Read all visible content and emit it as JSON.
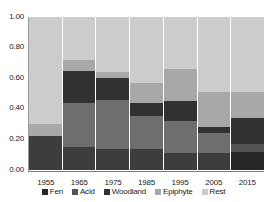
{
  "chart_data": {
    "type": "bar",
    "subtype": "stacked-bar-100",
    "title": "",
    "xlabel": "",
    "ylabel": "",
    "ylim": [
      0.0,
      1.0
    ],
    "ytick_labels": [
      "1.00",
      "0.80",
      "0.60",
      "0.40",
      "0.20",
      "0.00"
    ],
    "ytick_values": [
      1.0,
      0.8,
      0.6,
      0.4,
      0.2,
      0.0
    ],
    "grid": false,
    "legend_position": "bottom",
    "categories": [
      "1955",
      "1965",
      "1975",
      "1985",
      "1995",
      "2005",
      "2015"
    ],
    "series": [
      {
        "name": "Fen",
        "color": "#262626",
        "values": [
          0.0,
          0.0,
          0.0,
          0.0,
          0.0,
          0.0,
          0.12
        ]
      },
      {
        "name": "Acid",
        "color": "#3d3d3d",
        "values": [
          0.22,
          0.15,
          0.14,
          0.14,
          0.11,
          0.11,
          0.05
        ]
      },
      {
        "name": "Woodland",
        "color": "#6e6e6e",
        "values": [
          0.0,
          0.29,
          0.32,
          0.21,
          0.21,
          0.13,
          0.05
        ]
      },
      {
        "name": "Epiphyte",
        "color": "#313131",
        "values": [
          0.0,
          0.21,
          0.14,
          0.08,
          0.13,
          0.04,
          0.12
        ]
      },
      {
        "name": "Rest",
        "color": "#a8a8a8",
        "values": [
          0.08,
          0.07,
          0.0,
          0.14,
          0.21,
          0.23,
          0.17
        ]
      },
      {
        "name": "Top",
        "color": "#cccccc",
        "values": [
          0.7,
          0.28,
          0.4,
          0.43,
          0.34,
          0.49,
          0.49
        ]
      }
    ],
    "stacks": [
      {
        "category": "1955",
        "segments": [
          {
            "name": "Acid",
            "value": 0.22,
            "color": "#3d3d3d"
          },
          {
            "name": "Epiphyte",
            "value": 0.08,
            "color": "#a8a8a8"
          },
          {
            "name": "Rest",
            "value": 0.7,
            "color": "#cccccc"
          }
        ]
      },
      {
        "category": "1965",
        "segments": [
          {
            "name": "Acid",
            "value": 0.15,
            "color": "#3d3d3d"
          },
          {
            "name": "Woodland-lower",
            "value": 0.29,
            "color": "#6e6e6e"
          },
          {
            "name": "Woodland",
            "value": 0.21,
            "color": "#313131"
          },
          {
            "name": "Epiphyte",
            "value": 0.07,
            "color": "#a8a8a8"
          },
          {
            "name": "Rest",
            "value": 0.28,
            "color": "#cccccc"
          }
        ]
      },
      {
        "category": "1975",
        "segments": [
          {
            "name": "Acid",
            "value": 0.14,
            "color": "#3d3d3d"
          },
          {
            "name": "Woodland-lower",
            "value": 0.32,
            "color": "#6e6e6e"
          },
          {
            "name": "Woodland",
            "value": 0.14,
            "color": "#313131"
          },
          {
            "name": "Epiphyte",
            "value": 0.04,
            "color": "#a8a8a8"
          },
          {
            "name": "Rest",
            "value": 0.36,
            "color": "#cccccc"
          }
        ]
      },
      {
        "category": "1985",
        "segments": [
          {
            "name": "Acid",
            "value": 0.14,
            "color": "#3d3d3d"
          },
          {
            "name": "Woodland-lower",
            "value": 0.21,
            "color": "#6e6e6e"
          },
          {
            "name": "Woodland",
            "value": 0.09,
            "color": "#313131"
          },
          {
            "name": "Epiphyte",
            "value": 0.13,
            "color": "#a8a8a8"
          },
          {
            "name": "Rest",
            "value": 0.43,
            "color": "#cccccc"
          }
        ]
      },
      {
        "category": "1995",
        "segments": [
          {
            "name": "Acid",
            "value": 0.11,
            "color": "#3d3d3d"
          },
          {
            "name": "Woodland-lower",
            "value": 0.21,
            "color": "#6e6e6e"
          },
          {
            "name": "Woodland",
            "value": 0.13,
            "color": "#313131"
          },
          {
            "name": "Epiphyte",
            "value": 0.21,
            "color": "#a8a8a8"
          },
          {
            "name": "Rest",
            "value": 0.34,
            "color": "#cccccc"
          }
        ]
      },
      {
        "category": "2005",
        "segments": [
          {
            "name": "Acid",
            "value": 0.11,
            "color": "#3d3d3d"
          },
          {
            "name": "Woodland-lower",
            "value": 0.13,
            "color": "#6e6e6e"
          },
          {
            "name": "Woodland",
            "value": 0.04,
            "color": "#313131"
          },
          {
            "name": "Epiphyte",
            "value": 0.23,
            "color": "#a8a8a8"
          },
          {
            "name": "Rest",
            "value": 0.49,
            "color": "#cccccc"
          }
        ]
      },
      {
        "category": "2015",
        "segments": [
          {
            "name": "Fen",
            "value": 0.12,
            "color": "#262626"
          },
          {
            "name": "Acid",
            "value": 0.05,
            "color": "#545454"
          },
          {
            "name": "Woodland",
            "value": 0.17,
            "color": "#313131"
          },
          {
            "name": "Epiphyte",
            "value": 0.17,
            "color": "#a8a8a8"
          },
          {
            "name": "Rest",
            "value": 0.49,
            "color": "#cccccc"
          }
        ]
      }
    ],
    "legend": [
      {
        "label": "Fen",
        "color": "#262626"
      },
      {
        "label": "Acid",
        "color": "#545454"
      },
      {
        "label": "Woodland",
        "color": "#313131"
      },
      {
        "label": "Epiphyte",
        "color": "#a8a8a8"
      },
      {
        "label": "Rest",
        "color": "#cccccc"
      }
    ]
  },
  "axis": {
    "y_ticks": [
      "1.00",
      "0.80",
      "0.60",
      "0.40",
      "0.20",
      "0.00"
    ],
    "x_ticks": [
      "1955",
      "1965",
      "1975",
      "1985",
      "1995",
      "2005",
      "2015"
    ]
  },
  "title_strip": {
    "text": ""
  }
}
